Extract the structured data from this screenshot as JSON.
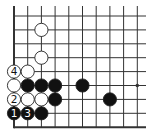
{
  "diagram": {
    "type": "go-board-fragment",
    "grid": {
      "origin_x": 14,
      "origin_y": 16,
      "spacing_x": 13.7,
      "spacing_y": 13.9,
      "cols": 10,
      "rows": 9,
      "left_edge": true,
      "bottom_edge": true,
      "line_color": "#333333",
      "edge_width": 2
    },
    "star_points": [
      {
        "col": 9,
        "row": 5
      }
    ],
    "stones": [
      {
        "color": "white",
        "col": 2,
        "row": 1,
        "label": ""
      },
      {
        "color": "white",
        "col": 2,
        "row": 3,
        "label": ""
      },
      {
        "color": "white",
        "col": 0,
        "row": 4,
        "label": "4"
      },
      {
        "color": "white",
        "col": 1,
        "row": 4,
        "label": ""
      },
      {
        "color": "white",
        "col": 0,
        "row": 5,
        "label": ""
      },
      {
        "color": "black",
        "col": 1,
        "row": 5,
        "label": ""
      },
      {
        "color": "black",
        "col": 2,
        "row": 5,
        "label": ""
      },
      {
        "color": "black",
        "col": 3,
        "row": 5,
        "label": ""
      },
      {
        "color": "black",
        "col": 5,
        "row": 5,
        "label": ""
      },
      {
        "color": "white",
        "col": 0,
        "row": 6,
        "label": "2"
      },
      {
        "color": "white",
        "col": 1,
        "row": 6,
        "label": ""
      },
      {
        "color": "white",
        "col": 2,
        "row": 6,
        "label": ""
      },
      {
        "color": "black",
        "col": 3,
        "row": 6,
        "label": ""
      },
      {
        "color": "black",
        "col": 7,
        "row": 6,
        "label": ""
      },
      {
        "color": "black",
        "col": 0,
        "row": 7,
        "label": "1"
      },
      {
        "color": "black",
        "col": 1,
        "row": 7,
        "label": "3"
      },
      {
        "color": "black",
        "col": 2,
        "row": 7,
        "label": ""
      }
    ],
    "colors": {
      "black_stone": "#111111",
      "white_stone": "#ffffff",
      "stone_outline": "#222222",
      "background": "#ffffff"
    }
  }
}
